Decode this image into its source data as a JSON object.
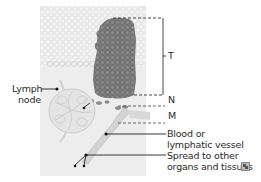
{
  "diagram": {
    "labels": {
      "t": "T",
      "n": "N",
      "m": "M",
      "lymph_node_line1": "Lymph",
      "lymph_node_line2": "node",
      "vessel_line1": "Blood or",
      "vessel_line2": "lymphatic vessel",
      "spread_line1": "Spread to other",
      "spread_line2": "organs and tissues"
    },
    "icons": {
      "expand": "expand-icon"
    },
    "colors": {
      "tissue_bg": "#ececec",
      "cells_bg": "#f3f3f3",
      "tumor": "#7a7a7a",
      "tumor_cell_edge": "#5f5f5f",
      "lymph_node": "#dcdcdc",
      "vessel": "#cfcfcf",
      "line": "#222222",
      "dash": "#444444"
    }
  }
}
